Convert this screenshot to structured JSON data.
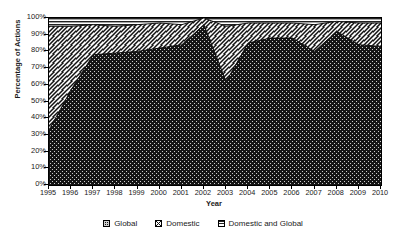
{
  "chart_data": {
    "type": "area",
    "title": "",
    "xlabel": "Year",
    "ylabel": "Percentage of Actions",
    "stacked": true,
    "normalized_percent": true,
    "grid": false,
    "legend_position": "bottom",
    "ylim": [
      0,
      100
    ],
    "ytick_labels": [
      "100%",
      "90%",
      "80%",
      "70%",
      "60%",
      "50%",
      "40%",
      "30%",
      "20%",
      "10%",
      "0%"
    ],
    "ytick_values": [
      100,
      90,
      80,
      70,
      60,
      50,
      40,
      30,
      20,
      10,
      0
    ],
    "categories": [
      "1995",
      "1996",
      "1997",
      "1998",
      "1999",
      "2000",
      "2001",
      "2002",
      "2003",
      "2004",
      "2005",
      "2006",
      "2007",
      "2008",
      "2009",
      "2010"
    ],
    "x": [
      1995,
      1996,
      1997,
      1998,
      1999,
      2000,
      2001,
      2002,
      2003,
      2004,
      2005,
      2006,
      2007,
      2008,
      2009,
      2010
    ],
    "series": [
      {
        "name": "Global",
        "pattern": "dotted-dark",
        "color": "#1c1c1c",
        "values": [
          33,
          57,
          78,
          79,
          80,
          82,
          84,
          96,
          62,
          85,
          88,
          88,
          80,
          92,
          84,
          83
        ]
      },
      {
        "name": "Domestic",
        "pattern": "diagonal-crosshatch",
        "color": "#f2f2f2",
        "values": [
          62,
          38,
          18,
          16,
          16,
          15,
          12,
          4,
          33,
          12,
          9,
          9,
          16,
          6,
          13,
          14
        ]
      },
      {
        "name": "Domestic and Global",
        "pattern": "horizontal-lines",
        "color": "#d8d8d8",
        "values": [
          5,
          5,
          4,
          5,
          4,
          3,
          4,
          0,
          5,
          3,
          3,
          3,
          4,
          2,
          3,
          3
        ]
      }
    ],
    "cumulative_global": [
      33,
      57,
      78,
      79,
      80,
      82,
      84,
      96,
      62,
      85,
      88,
      88,
      80,
      92,
      84,
      83
    ],
    "cumulative_global_domestic": [
      95,
      95,
      96,
      95,
      96,
      97,
      96,
      100,
      95,
      97,
      97,
      97,
      96,
      98,
      97,
      97
    ]
  },
  "axes": {
    "y_title": "Percentage of Actions",
    "x_title": "Year"
  },
  "legend": {
    "items": [
      {
        "label": "Global",
        "swatch": "legend-swatch-global"
      },
      {
        "label": "Domestic",
        "swatch": "legend-swatch-domestic"
      },
      {
        "label": "Domestic and Global",
        "swatch": "legend-swatch-domestic-and-global"
      }
    ]
  },
  "colors": {
    "global": "#1c1c1c",
    "domestic": "#f2f2f2",
    "domestic_and_global": "#d8d8d8",
    "axis": "#000000",
    "background": "#ffffff"
  }
}
